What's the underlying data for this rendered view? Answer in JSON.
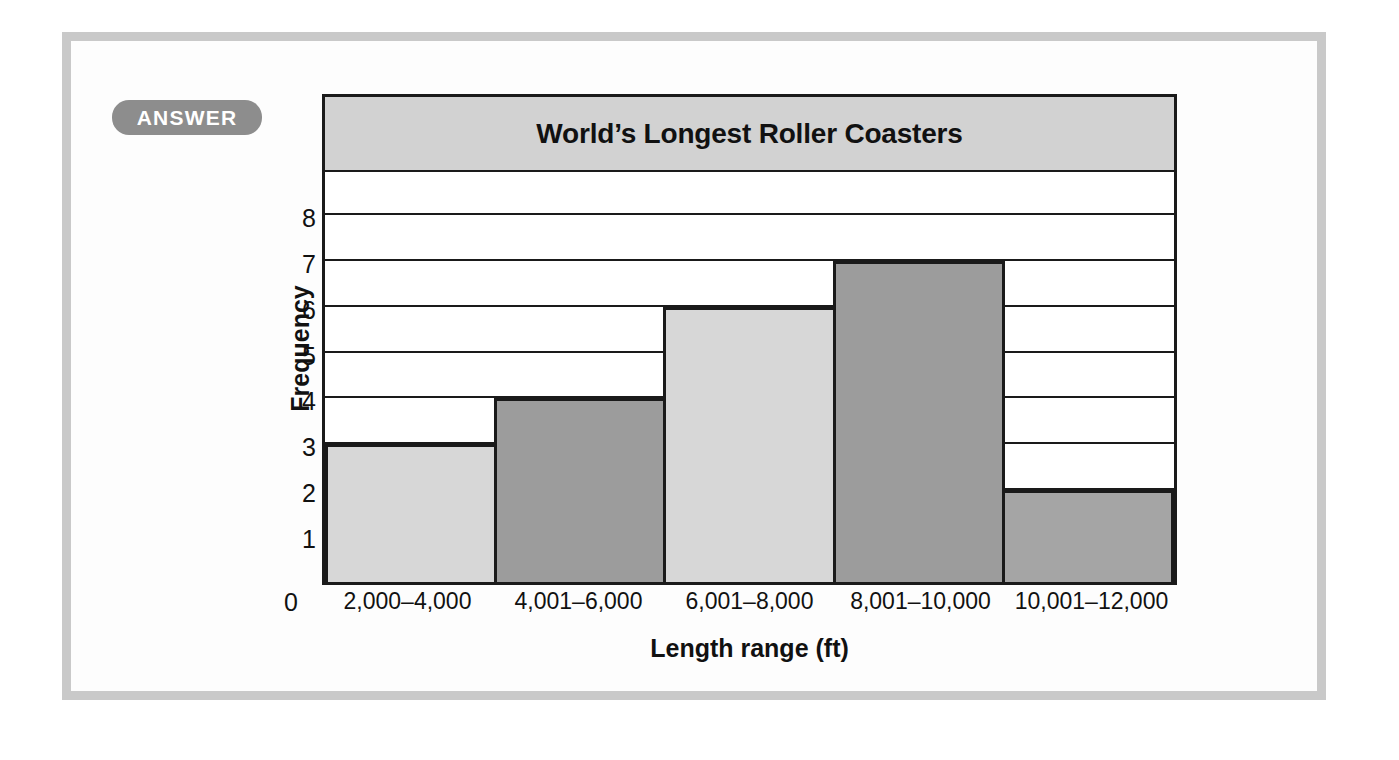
{
  "badge": {
    "label": "ANSWER"
  },
  "chart_data": {
    "type": "bar",
    "title": "World’s Longest Roller Coasters",
    "xlabel": "Length range (ft)",
    "ylabel": "Frequency",
    "categories": [
      "2,000–4,000",
      "4,001–6,000",
      "6,001–8,000",
      "8,001–10,000",
      "10,001–12,000"
    ],
    "values": [
      3,
      4,
      6,
      7,
      2
    ],
    "bar_colors": [
      "#d7d7d7",
      "#9c9c9c",
      "#d7d7d7",
      "#9c9c9c",
      "#a5a5a5"
    ],
    "ylim": [
      0,
      9
    ],
    "ytick_labels": [
      "0",
      "1",
      "2",
      "3",
      "4",
      "5",
      "6",
      "7",
      "8"
    ],
    "ytick_values": [
      0,
      1,
      2,
      3,
      4,
      5,
      6,
      7,
      8
    ],
    "origin_label": "0",
    "grid": true,
    "grid_axis": "y",
    "legend": "none",
    "title_band_color": "#d2d2d2",
    "axis_color": "#1a1a1a",
    "plot_background": "#ffffff"
  },
  "page": {
    "frame_color": "#c9c9c9",
    "background": "#fdfdfd"
  }
}
